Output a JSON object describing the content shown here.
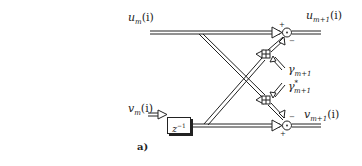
{
  "figure": {
    "caption": "a)",
    "inputs": {
      "u_in": {
        "base": "u",
        "sub": "m",
        "arg": "(i)"
      },
      "v_in": {
        "base": "v",
        "sub": "m",
        "arg": "(i)"
      }
    },
    "outputs": {
      "u_out": {
        "base": "u",
        "sub": "m+1",
        "arg": "(i)"
      },
      "v_out": {
        "base": "v",
        "sub": "m+1",
        "arg": "(i)"
      }
    },
    "coefficients": {
      "gamma": {
        "base": "γ",
        "sub": "m+1",
        "sup": ""
      },
      "gamma_conj": {
        "base": "γ",
        "sub": "m+1",
        "sup": "*"
      }
    },
    "delay": {
      "base": "z",
      "sup": "−1"
    },
    "sum_signs": {
      "top": {
        "plus": "+",
        "minus": "−"
      },
      "bottom": {
        "plus": "+",
        "minus": "−"
      }
    },
    "colors": {
      "line": "#222222",
      "background": "#ffffff"
    }
  }
}
